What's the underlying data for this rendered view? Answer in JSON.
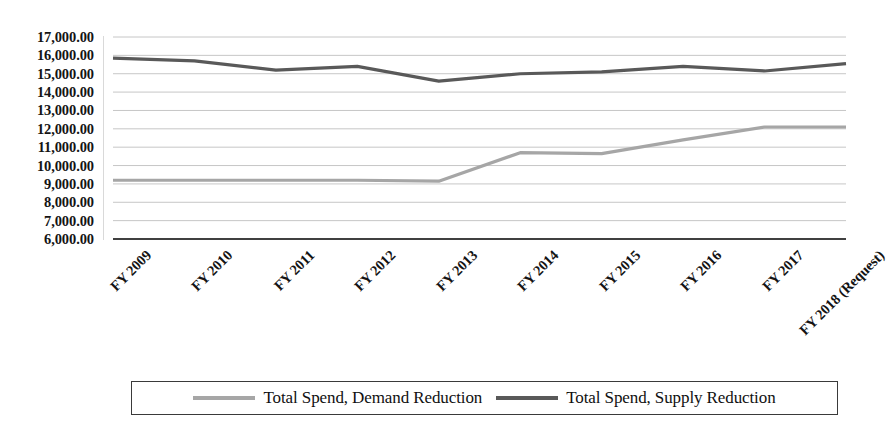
{
  "chart_data": {
    "type": "line",
    "title": "",
    "subtitle": "",
    "xlabel": "",
    "ylabel": "",
    "ylim": [
      6000,
      17000
    ],
    "ytick_step": 1000,
    "grid": true,
    "legend_position": "bottom",
    "categories": [
      "FY 2009",
      "FY 2010",
      "FY 2011",
      "FY 2012",
      "FY 2013",
      "FY 2014",
      "FY 2015",
      "FY 2016",
      "FY 2017",
      "FY 2018 (Request)"
    ],
    "ytick_labels": [
      "17,000.00",
      "16,000.00",
      "15,000.00",
      "14,000.00",
      "13,000.00",
      "12,000.00",
      "11,000.00",
      "10,000.00",
      "9,000.00",
      "8,000.00",
      "7,000.00",
      "6,000.00"
    ],
    "ytick_values": [
      17000,
      16000,
      15000,
      14000,
      13000,
      12000,
      11000,
      10000,
      9000,
      8000,
      7000,
      6000
    ],
    "series": [
      {
        "name": "Total Spend, Demand Reduction",
        "color": "#a6a6a6",
        "values": [
          9200,
          9200,
          9200,
          9200,
          9150,
          10700,
          10650,
          11400,
          12100,
          12100
        ]
      },
      {
        "name": "Total Spend, Supply Reduction",
        "color": "#595959",
        "values": [
          15850,
          15700,
          15200,
          15400,
          14600,
          15000,
          15100,
          15400,
          15150,
          15550
        ]
      }
    ]
  },
  "legend": {
    "entries": [
      {
        "label": "Total Spend, Demand Reduction",
        "color": "#a6a6a6"
      },
      {
        "label": "Total Spend, Supply Reduction",
        "color": "#595959"
      }
    ]
  },
  "colors": {
    "demand_reduction": "#a6a6a6",
    "supply_reduction": "#595959",
    "gridline": "#bfbfbf",
    "axis": "#404040",
    "text": "#141414",
    "background": "#ffffff"
  }
}
